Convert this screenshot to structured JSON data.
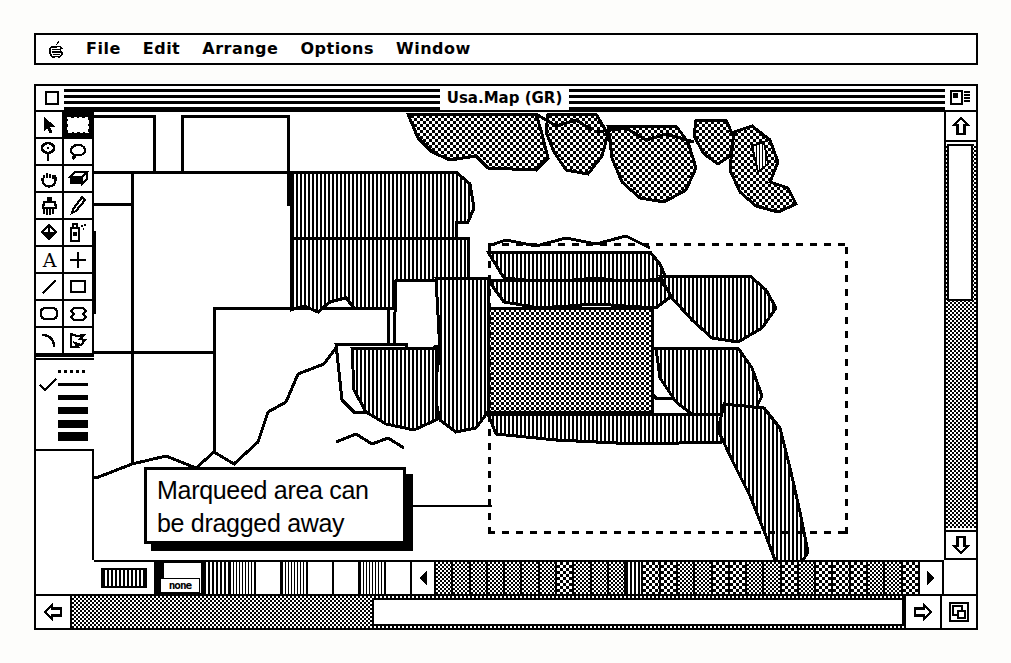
{
  "menubar": {
    "apple_icon": "apple-logo-icon",
    "items": [
      {
        "label": "File"
      },
      {
        "label": "Edit"
      },
      {
        "label": "Arrange"
      },
      {
        "label": "Options"
      },
      {
        "label": "Window"
      }
    ]
  },
  "window": {
    "title": "Usa.Map (GR)",
    "close_box": "close-box-icon",
    "zoom_box": "zoom-box-icon",
    "grow_box": "grow-box-icon"
  },
  "tools": {
    "rows": [
      [
        {
          "name": "arrow-pointer-tool",
          "selected": false
        },
        {
          "name": "marquee-selection-tool",
          "selected": true
        }
      ],
      [
        {
          "name": "lasso-tool",
          "selected": false
        },
        {
          "name": "lasso-freehand-tool",
          "selected": false
        }
      ],
      [
        {
          "name": "grabber-hand-tool",
          "selected": false
        },
        {
          "name": "eraser-tool",
          "selected": false
        }
      ],
      [
        {
          "name": "paintbrush-tool",
          "selected": false
        },
        {
          "name": "pencil-tool",
          "selected": false
        }
      ],
      [
        {
          "name": "paint-bucket-tool",
          "selected": false
        },
        {
          "name": "spray-can-tool",
          "selected": false
        }
      ],
      [
        {
          "name": "text-tool",
          "selected": false
        },
        {
          "name": "crosshair-point-tool",
          "selected": false
        }
      ],
      [
        {
          "name": "line-tool",
          "selected": false
        },
        {
          "name": "rectangle-tool",
          "selected": false
        }
      ],
      [
        {
          "name": "rounded-rectangle-tool",
          "selected": false
        },
        {
          "name": "polygon-tool",
          "selected": false
        }
      ],
      [
        {
          "name": "arc-curve-tool",
          "selected": false
        },
        {
          "name": "freeform-polygon-tool",
          "selected": false
        }
      ]
    ]
  },
  "line_widths": {
    "selected_index": 0,
    "checkmark_icon": "checkmark-icon",
    "options": [
      {
        "name": "line-width-dotted",
        "thickness": 0,
        "style": "dotted"
      },
      {
        "name": "line-width-1",
        "thickness": 3,
        "style": "solid"
      },
      {
        "name": "line-width-2",
        "thickness": 5,
        "style": "solid"
      },
      {
        "name": "line-width-3",
        "thickness": 7,
        "style": "solid"
      },
      {
        "name": "line-width-4",
        "thickness": 8,
        "style": "solid"
      },
      {
        "name": "line-width-5",
        "thickness": 9,
        "style": "solid"
      }
    ]
  },
  "pattern_bar": {
    "current_pattern": "vertical-stripes",
    "none_label": "none",
    "left_arrow": "pattern-scroll-left-icon",
    "right_arrow": "pattern-scroll-right-icon",
    "near_swatches": [
      "white",
      "vstripe",
      "white",
      "vstripe-fine",
      "white",
      "white",
      "vstripe-fine",
      "white"
    ],
    "scroll_swatches": [
      "dither50",
      "dither50",
      "dither50",
      "dither50",
      "dither50",
      "dither50",
      "dither50",
      "dither25",
      "dither50",
      "dither50",
      "dither50",
      "vstripe",
      "dither25",
      "dither25",
      "dither50",
      "dither50",
      "dither25",
      "dither25",
      "dither50",
      "dither50",
      "dither25",
      "dither50",
      "dither25",
      "dither25",
      "dither25",
      "dither50",
      "dither50",
      "dither25"
    ]
  },
  "scrollbars": {
    "vertical": {
      "up_arrow": "scroll-up-arrow-icon",
      "down_arrow": "scroll-down-arrow-icon",
      "thumb_top_pct": 0,
      "thumb_height_pct": 41
    },
    "horizontal": {
      "left_arrow": "scroll-left-arrow-icon",
      "right_arrow": "scroll-right-arrow-icon",
      "thumb_left_pct": 36,
      "thumb_width_pct": 64
    }
  },
  "callout": {
    "line1": "Marqueed area can",
    "line2": "be dragged away"
  },
  "marquee": {
    "name": "marquee-selection-region",
    "border_style": "dashed"
  }
}
